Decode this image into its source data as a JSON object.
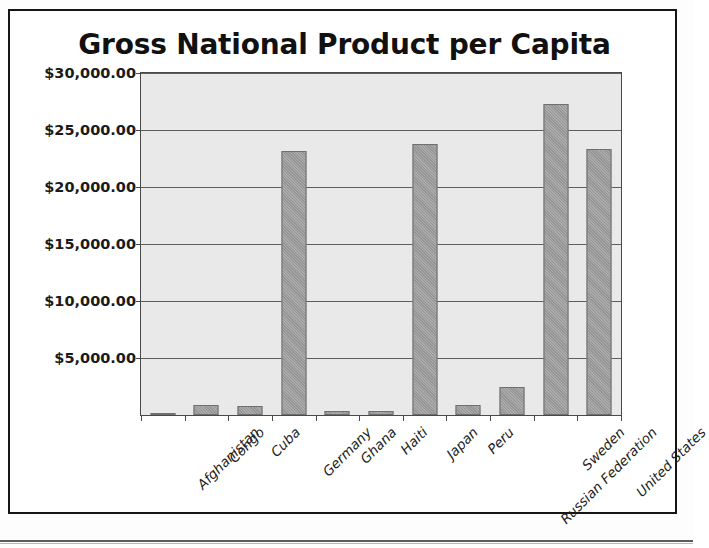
{
  "chart_data": {
    "type": "bar",
    "title": "Gross National Product per Capita",
    "xlabel": "",
    "ylabel": "",
    "ylim": [
      0,
      30000
    ],
    "grid": true,
    "legend": "none",
    "y_tick_labels": [
      "$30,000.00",
      "$25,000.00",
      "$20,000.00",
      "$15,000.00",
      "$10,000.00",
      "$5,000.00"
    ],
    "y_tick_values": [
      30000,
      25000,
      20000,
      15000,
      10000,
      5000
    ],
    "categories": [
      "Afghanistan",
      "Congo",
      "Cuba",
      "Germany",
      "Ghana",
      "Haiti",
      "Japan",
      "Peru",
      "Russian Federation",
      "Sweden",
      "United States"
    ],
    "values": [
      160,
      880,
      790,
      23160,
      390,
      330,
      23770,
      880,
      2450,
      27280,
      23330
    ],
    "series": [
      {
        "name": "GNP per Capita",
        "values": [
          160,
          880,
          790,
          23160,
          390,
          330,
          23770,
          880,
          2450,
          27280,
          23330
        ]
      }
    ],
    "colors": {
      "bar_fill": "#9d9d9d",
      "bar_stroke": "#6f6f6f",
      "plot_background": "#e9e9e9",
      "gridline": "#5e5e5e",
      "axis": "#4a4a4a",
      "text": "#1a1a1a",
      "page_background": "#ffffff",
      "frame_border": "#151515"
    }
  }
}
